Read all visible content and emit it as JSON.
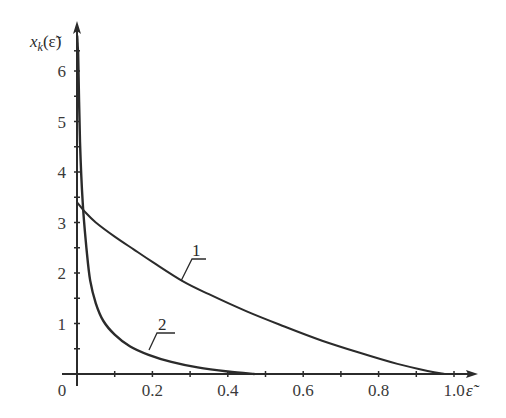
{
  "chart_data": {
    "type": "line",
    "title": "",
    "xlabel": "ε̃",
    "ylabel": "x_k(ε̃)",
    "xlim": [
      0,
      1.05
    ],
    "ylim": [
      0,
      6.9
    ],
    "grid": false,
    "x_ticks": [
      {
        "value": 0,
        "label": "0"
      },
      {
        "value": 0.2,
        "label": "0.2"
      },
      {
        "value": 0.4,
        "label": "0.4"
      },
      {
        "value": 0.6,
        "label": "0.6"
      },
      {
        "value": 0.8,
        "label": "0.8"
      },
      {
        "value": 1.0,
        "label": "1.0"
      }
    ],
    "x_minor_ticks": [
      0.1,
      0.3,
      0.5,
      0.7,
      0.9
    ],
    "y_ticks": [
      {
        "value": 1,
        "label": "1"
      },
      {
        "value": 2,
        "label": "2"
      },
      {
        "value": 3,
        "label": "3"
      },
      {
        "value": 4,
        "label": "4"
      },
      {
        "value": 5,
        "label": "5"
      },
      {
        "value": 6,
        "label": "6"
      }
    ],
    "y_minor_ticks": [
      0.5,
      1.5,
      2.5,
      3.5,
      4.5,
      5.5,
      6.4
    ],
    "series": [
      {
        "name": "1",
        "x": [
          0,
          0.02,
          0.05,
          0.1,
          0.15,
          0.2,
          0.28,
          0.35,
          0.45,
          0.55,
          0.65,
          0.75,
          0.85,
          0.93,
          0.975
        ],
        "y": [
          3.4,
          3.22,
          3.0,
          2.72,
          2.47,
          2.22,
          1.84,
          1.58,
          1.24,
          0.94,
          0.66,
          0.42,
          0.2,
          0.06,
          0.0
        ]
      },
      {
        "name": "2",
        "x": [
          0.003,
          0.008,
          0.015,
          0.025,
          0.035,
          0.05,
          0.07,
          0.1,
          0.14,
          0.19,
          0.25,
          0.32,
          0.4,
          0.47
        ],
        "y": [
          6.4,
          4.6,
          3.4,
          2.5,
          1.85,
          1.4,
          1.05,
          0.78,
          0.55,
          0.38,
          0.24,
          0.13,
          0.05,
          0.0
        ]
      }
    ],
    "annotations": [
      {
        "text": "1",
        "series": "1",
        "at_x": 0.28
      },
      {
        "text": "2",
        "series": "2",
        "at_x": 0.19
      }
    ]
  },
  "labels": {
    "origin": "0",
    "x_axis_title": "ε̃",
    "y_axis_title_base": "x",
    "y_axis_title_sub": "k",
    "y_axis_title_arg": "(ε̃)",
    "curve1": "1",
    "curve2": "2"
  }
}
